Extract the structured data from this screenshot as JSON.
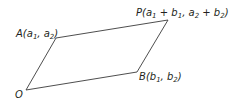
{
  "diagram": {
    "type": "parallelogram",
    "colors": {
      "line": "#3a3a3a",
      "text": "#231f20",
      "background": "#ffffff"
    },
    "vertices": {
      "O": {
        "x": 26,
        "y": 90
      },
      "A": {
        "x": 56,
        "y": 38
      },
      "P": {
        "x": 168,
        "y": 20
      },
      "B": {
        "x": 137,
        "y": 72
      }
    },
    "labels": {
      "O": {
        "name": "O"
      },
      "A": {
        "name": "A",
        "open": "(",
        "c1": "a",
        "c1sub": "1",
        "sep": ", ",
        "c2": "a",
        "c2sub": "2",
        "close": ")"
      },
      "B": {
        "name": "B",
        "open": "(",
        "c1": "b",
        "c1sub": "1",
        "sep": ", ",
        "c2": "b",
        "c2sub": "2",
        "close": ")"
      },
      "P": {
        "name": "P",
        "open": "(",
        "t1": "a",
        "t1sub": "1",
        "plus1": " + ",
        "t2": "b",
        "t2sub": "1",
        "sep": ", ",
        "t3": "a",
        "t3sub": "2",
        "plus2": " + ",
        "t4": "b",
        "t4sub": "2",
        "close": ")"
      }
    }
  }
}
